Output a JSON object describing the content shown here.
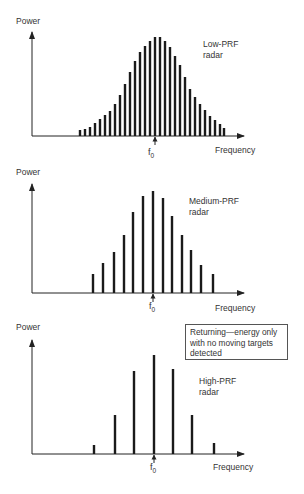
{
  "panels": [
    {
      "id": "low-prf",
      "y_label": "Power",
      "x_label": "Frequency",
      "center_label": "f",
      "center_sub": "0",
      "title_lines": [
        "Low-PRF",
        "radar"
      ],
      "axis": {
        "x0": 32,
        "y0": 136,
        "x_end": 244,
        "y_top": 32
      },
      "label_pos": {
        "power": [
          16,
          24
        ],
        "frequency": [
          215,
          153
        ],
        "title": [
          203,
          47
        ],
        "f0": [
          148,
          155
        ]
      },
      "bar_width": 2.4
    },
    {
      "id": "medium-prf",
      "y_label": "Power",
      "x_label": "Frequency",
      "center_label": "f",
      "center_sub": "0",
      "title_lines": [
        "Medium-PRF",
        "radar"
      ],
      "axis": {
        "x0": 32,
        "y0": 293,
        "x_end": 244,
        "y_top": 184
      },
      "label_pos": {
        "power": [
          16,
          175
        ],
        "frequency": [
          215,
          311
        ],
        "title": [
          189,
          204
        ],
        "f0": [
          149,
          309
        ]
      },
      "bar_width": 2.4
    },
    {
      "id": "high-prf",
      "y_label": "Power",
      "x_label": "Frequency",
      "center_label": "f",
      "center_sub": "0",
      "title_lines": [
        "High-PRF",
        "radar"
      ],
      "axis": {
        "x0": 32,
        "y0": 454,
        "x_end": 244,
        "y_top": 340
      },
      "label_pos": {
        "power": [
          16,
          330
        ],
        "frequency": [
          213,
          470
        ],
        "title": [
          199,
          384
        ],
        "f0": [
          150,
          470
        ]
      },
      "bar_width": 2.4
    }
  ],
  "note": {
    "lines": [
      "Returning—energy only",
      "with no moving targets",
      "detected"
    ]
  },
  "chart_data": [
    {
      "type": "bar",
      "title": "Low-PRF radar",
      "xlabel": "Frequency",
      "ylabel": "Power",
      "center_marker": "f0",
      "x": [
        80,
        85,
        90,
        95,
        100,
        105,
        110,
        115,
        120,
        125,
        130,
        135,
        140,
        145,
        150,
        155,
        160,
        165,
        170,
        175,
        180,
        185,
        190,
        195,
        200,
        205,
        210,
        215,
        220,
        224
      ],
      "heights": [
        6,
        7,
        9,
        13,
        17,
        21,
        25,
        32,
        41,
        52,
        64,
        75,
        84,
        90,
        95,
        99,
        99,
        95,
        89,
        80,
        71,
        59,
        47,
        39,
        32,
        26,
        20,
        16,
        12,
        8
      ]
    },
    {
      "type": "bar",
      "title": "Medium-PRF radar",
      "xlabel": "Frequency",
      "ylabel": "Power",
      "center_marker": "f0",
      "x": [
        93,
        103,
        114,
        124,
        133,
        143,
        153,
        163,
        172,
        182,
        191,
        201,
        213
      ],
      "heights": [
        19,
        30,
        41,
        58,
        81,
        97,
        102,
        95,
        77,
        58,
        43,
        28,
        19
      ]
    },
    {
      "type": "bar",
      "title": "High-PRF radar",
      "xlabel": "Frequency",
      "ylabel": "Power",
      "center_marker": "f0",
      "x": [
        94,
        115,
        134,
        154,
        173,
        192,
        214
      ],
      "heights": [
        9,
        39,
        83,
        99,
        85,
        39,
        11
      ]
    }
  ]
}
